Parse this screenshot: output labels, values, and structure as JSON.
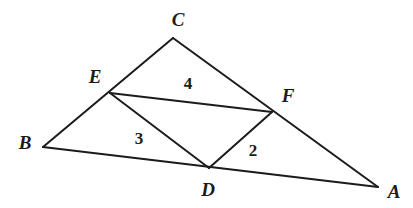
{
  "figure": {
    "background_color": "#ffffff",
    "stroke_color": "#1b1b1b",
    "label_color": "#1b1b1b",
    "stroke_width": 2,
    "width": 413,
    "height": 208
  },
  "vertices": [
    {
      "id": "A",
      "label": "A",
      "x": 378,
      "y": 187,
      "label_x": 394,
      "label_y": 191
    },
    {
      "id": "B",
      "label": "B",
      "x": 43,
      "y": 147,
      "label_x": 25,
      "label_y": 142
    },
    {
      "id": "C",
      "label": "C",
      "x": 173,
      "y": 38,
      "label_x": 178,
      "label_y": 19
    },
    {
      "id": "D",
      "label": "D",
      "x": 209,
      "y": 168,
      "label_x": 208,
      "label_y": 189
    },
    {
      "id": "E",
      "label": "E",
      "x": 110,
      "y": 93,
      "label_x": 95,
      "label_y": 76
    },
    {
      "id": "F",
      "label": "F",
      "x": 272,
      "y": 112,
      "label_x": 288,
      "label_y": 95
    }
  ],
  "segments": [
    {
      "id": "BC",
      "from": "B",
      "to": "C",
      "name": "side-bc"
    },
    {
      "id": "CA",
      "from": "C",
      "to": "A",
      "name": "side-ca"
    },
    {
      "id": "BA",
      "from": "B",
      "to": "A",
      "name": "side-ba"
    },
    {
      "id": "EF",
      "from": "E",
      "to": "F",
      "name": "midsegment-ef"
    },
    {
      "id": "ED",
      "from": "E",
      "to": "D",
      "name": "midsegment-ed"
    },
    {
      "id": "DF",
      "from": "D",
      "to": "F",
      "name": "midsegment-df"
    }
  ],
  "region_labels": [
    {
      "id": "region-4",
      "label": "4",
      "x": 188,
      "y": 83
    },
    {
      "id": "region-3",
      "label": "3",
      "x": 139,
      "y": 138
    },
    {
      "id": "region-2",
      "label": "2",
      "x": 253,
      "y": 150
    }
  ]
}
